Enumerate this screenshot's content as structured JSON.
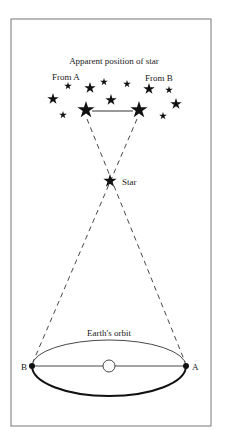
{
  "diagram": {
    "title": "Apparent position of star",
    "label_from_a": "From A",
    "label_from_b": "From B",
    "label_star": "Star",
    "label_orbit": "Earth's orbit",
    "label_point_a": "A",
    "label_point_b": "B",
    "colors": {
      "ink": "#111111",
      "frame": "#777777",
      "background": "#ffffff"
    },
    "background_stars": [
      {
        "x": 68,
        "y": 86,
        "r": 4
      },
      {
        "x": 90,
        "y": 88,
        "r": 6
      },
      {
        "x": 104,
        "y": 82,
        "r": 4
      },
      {
        "x": 127,
        "y": 84,
        "r": 4
      },
      {
        "x": 149,
        "y": 89,
        "r": 6
      },
      {
        "x": 169,
        "y": 90,
        "r": 4
      },
      {
        "x": 53,
        "y": 99,
        "r": 6
      },
      {
        "x": 111,
        "y": 100,
        "r": 6
      },
      {
        "x": 176,
        "y": 104,
        "r": 6
      },
      {
        "x": 63,
        "y": 115,
        "r": 4
      },
      {
        "x": 163,
        "y": 116,
        "r": 4
      }
    ],
    "apparent_star_a": {
      "x": 86,
      "y": 110,
      "r": 9
    },
    "apparent_star_b": {
      "x": 139,
      "y": 110,
      "r": 9
    },
    "near_star": {
      "x": 110,
      "y": 181,
      "r": 7
    },
    "orbit": {
      "cx": 109,
      "cy": 367,
      "rx": 77,
      "ry": 28
    },
    "point_a": {
      "x": 186,
      "y": 366
    },
    "point_b": {
      "x": 32,
      "y": 366
    },
    "sun": {
      "x": 109,
      "y": 366,
      "r": 6
    }
  }
}
